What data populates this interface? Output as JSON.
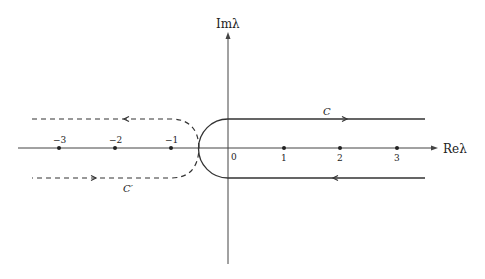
{
  "figure": {
    "axes": {
      "x_label": "Reλ",
      "y_label": "Imλ",
      "origin_label": "0"
    },
    "ticks": {
      "negative": [
        "−3",
        "−2",
        "−1"
      ],
      "positive": [
        "1",
        "2",
        "3"
      ]
    },
    "contours": {
      "solid": {
        "label": "C",
        "style": "solid",
        "direction": "upper branch rightward, lower branch leftward"
      },
      "dashed": {
        "label": "C′",
        "style": "dashed",
        "direction": "upper branch leftward, lower branch rightward"
      }
    },
    "colors": {
      "stroke": "#333333",
      "background": "#ffffff"
    }
  }
}
